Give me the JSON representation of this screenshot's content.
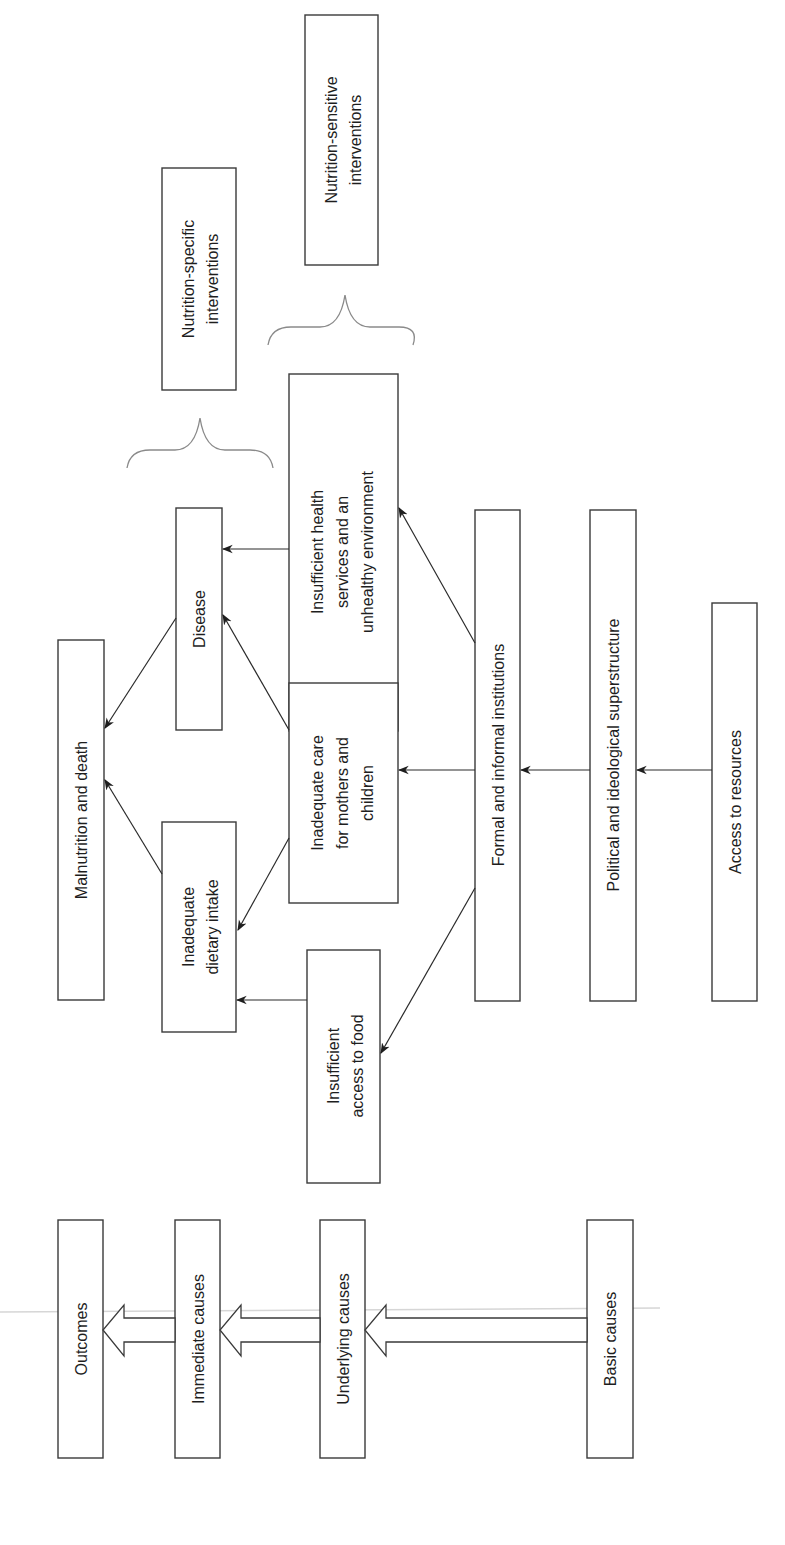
{
  "diagram": {
    "orientation": "rotated 90 degrees counter-clockwise",
    "levels": {
      "outcomes": "Outcomes",
      "immediate": "Immediate causes",
      "underlying": "Underlying causes",
      "basic": "Basic causes"
    },
    "nodes": {
      "malnutrition": [
        "Malnutrition and death"
      ],
      "disease": [
        "Disease"
      ],
      "dietary": [
        "Inadequate",
        "dietary intake"
      ],
      "health": [
        "Insufficient health",
        "services and an",
        "unhealthy environment"
      ],
      "care": [
        "Inadequate care",
        "for mothers and",
        "children"
      ],
      "food": [
        "Insufficient",
        "access to food"
      ],
      "institutions": [
        "Formal and informal institutions"
      ],
      "political": [
        "Political and ideological superstructure"
      ],
      "resources": [
        "Access to resources"
      ]
    },
    "interventions": {
      "specific": [
        "Nutrition-specific",
        "interventions"
      ],
      "sensitive": [
        "Nutrition-sensitive",
        "interventions"
      ]
    },
    "edges": [
      [
        "Inadequate dietary intake",
        "Malnutrition and death"
      ],
      [
        "Disease",
        "Malnutrition and death"
      ],
      [
        "Inadequate care for mothers and children",
        "Inadequate dietary intake"
      ],
      [
        "Inadequate care for mothers and children",
        "Disease"
      ],
      [
        "Insufficient access to food",
        "Inadequate dietary intake"
      ],
      [
        "Insufficient health services and an unhealthy environment",
        "Disease"
      ],
      [
        "Formal and informal institutions",
        "Insufficient access to food"
      ],
      [
        "Formal and informal institutions",
        "Inadequate care for mothers and children"
      ],
      [
        "Formal and informal institutions",
        "Insufficient health services and an unhealthy environment"
      ],
      [
        "Political and ideological superstructure",
        "Formal and informal institutions"
      ],
      [
        "Access to resources",
        "Political and ideological superstructure"
      ]
    ],
    "colors": {
      "line": "#2a2a2a",
      "box_border": "#3a3a3a",
      "brace": "#8a8a8a",
      "background": "#ffffff"
    }
  }
}
